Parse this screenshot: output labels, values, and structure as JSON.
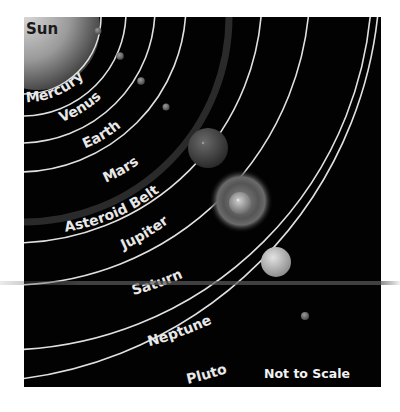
{
  "diagram": {
    "sun_label": "Sun",
    "scale_note": "Not to Scale",
    "bodies": [
      {
        "name": "Mercury",
        "label": "Mercury"
      },
      {
        "name": "Venus",
        "label": "Venus"
      },
      {
        "name": "Earth",
        "label": "Earth"
      },
      {
        "name": "Mars",
        "label": "Mars"
      },
      {
        "name": "Asteroid Belt",
        "label": "Asteroid Belt"
      },
      {
        "name": "Jupiter",
        "label": "Jupiter"
      },
      {
        "name": "Saturn",
        "label": "Saturn"
      },
      {
        "name": "Neptune",
        "label": "Neptune"
      },
      {
        "name": "Pluto",
        "label": "Pluto"
      }
    ],
    "colors": {
      "background": "#020202",
      "orbit": "#e0e0e0",
      "label": "#e8e8e8",
      "page": "#ffffff"
    }
  }
}
